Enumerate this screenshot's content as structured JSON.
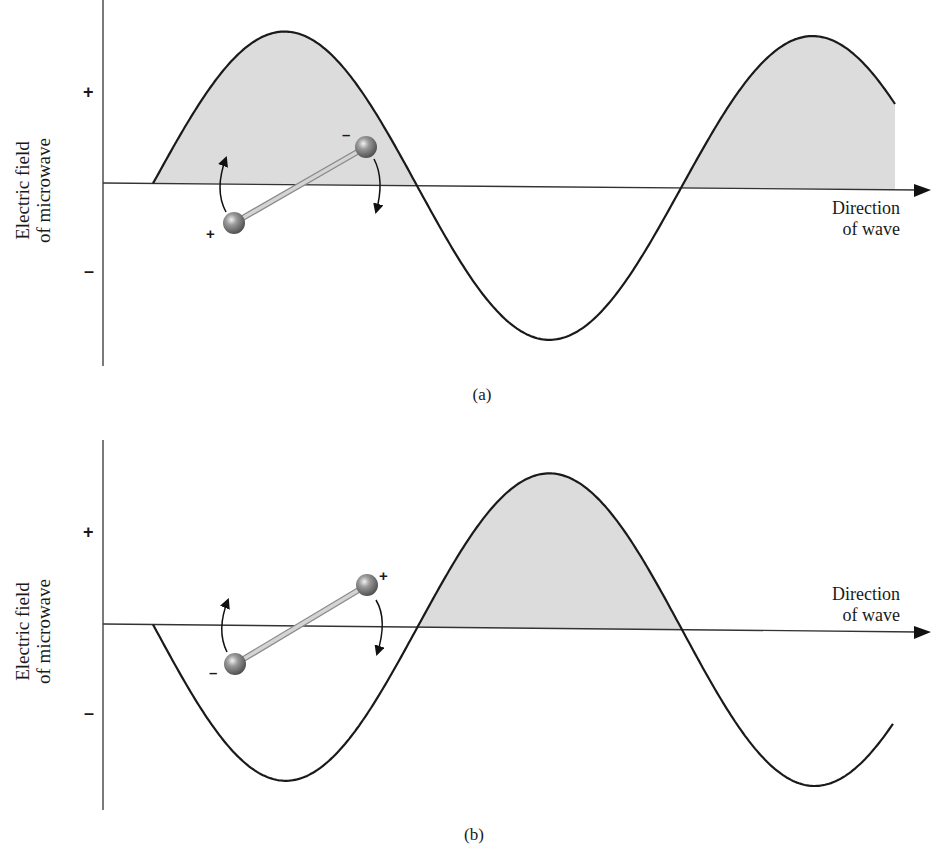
{
  "figure": {
    "panels": [
      {
        "id": "a",
        "caption": "(a)",
        "y_axis_label_line1": "Electric field",
        "y_axis_label_line2": "of microwave",
        "y_plus": "+",
        "y_minus": "–",
        "x_axis_label_line1": "Direction",
        "x_axis_label_line2": "of wave",
        "dipole": {
          "left_charge": "+",
          "right_charge": "–"
        }
      },
      {
        "id": "b",
        "caption": "(b)",
        "y_axis_label_line1": "Electric field",
        "y_axis_label_line2": "of microwave",
        "y_plus": "+",
        "y_minus": "–",
        "x_axis_label_line1": "Direction",
        "x_axis_label_line2": "of wave",
        "dipole": {
          "left_charge": "–",
          "right_charge": "+"
        }
      }
    ],
    "colors": {
      "wave_stroke": "#1a1a1a",
      "positive_fill": "#dcdcdc",
      "axis": "#333333",
      "atom": "#7a7a7a",
      "bond": "#c8c8c8"
    }
  },
  "chart_data": [
    {
      "type": "line",
      "title": "(a)",
      "xlabel": "Direction of wave",
      "ylabel": "Electric field of microwave",
      "y_ticks": [
        "+",
        "–"
      ],
      "shading": "positive half-cycles shaded gray",
      "wave": {
        "phase": "starts at zero going positive",
        "half_cycles": [
          "positive (shaded)",
          "negative",
          "positive (shaded, truncated)"
        ],
        "x": [
          0,
          0.25,
          0.5,
          0.75,
          1.0,
          1.25,
          1.41
        ],
        "y": [
          0,
          1,
          0,
          -1,
          0,
          1,
          0.55
        ]
      },
      "dipole_orientation": "+ end lower-left, – end upper-right; rotating counterclockwise arrows"
    },
    {
      "type": "line",
      "title": "(b)",
      "xlabel": "Direction of wave",
      "ylabel": "Electric field of microwave",
      "y_ticks": [
        "+",
        "–"
      ],
      "shading": "positive half-cycles shaded gray",
      "wave": {
        "phase": "starts at zero going negative",
        "half_cycles": [
          "negative",
          "positive (shaded)",
          "negative (truncated)"
        ],
        "x": [
          0,
          0.25,
          0.5,
          0.75,
          1.0,
          1.25,
          1.4
        ],
        "y": [
          0,
          -1,
          0,
          1,
          0,
          -1,
          -0.6
        ]
      },
      "dipole_orientation": "– end lower-left, + end upper-right; field reversed so dipole flips"
    }
  ]
}
